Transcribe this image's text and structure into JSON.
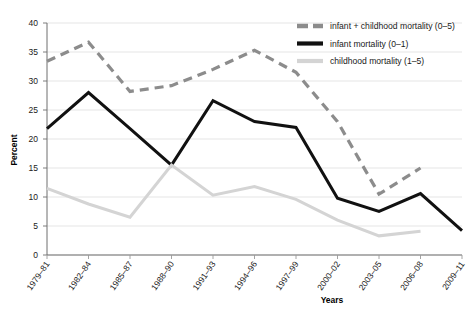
{
  "chart_data": {
    "type": "line",
    "title": "",
    "xlabel": "Years",
    "ylabel": "Percent",
    "ylim": [
      0,
      40
    ],
    "yticks": [
      0,
      5,
      10,
      15,
      20,
      25,
      30,
      35,
      40
    ],
    "grid": true,
    "legend_position": "top-right",
    "categories": [
      "1979–81",
      "1982–84",
      "1985–87",
      "1988–90",
      "1991–93",
      "1994–96",
      "1997–99",
      "2000–02",
      "2003–05",
      "2006–08",
      "2009–11"
    ],
    "series": [
      {
        "name": "infant + childhood mortality (0–5)",
        "color": "#8c8c8c",
        "style": "dashed",
        "width": 3.2,
        "values": [
          33.4,
          36.7,
          28.2,
          29.2,
          32.0,
          35.3,
          31.5,
          23.0,
          10.5,
          15.0,
          null
        ]
      },
      {
        "name": "infant mortality (0–1)",
        "color": "#111111",
        "style": "solid",
        "width": 3.0,
        "values": [
          21.8,
          28.0,
          21.8,
          15.5,
          26.6,
          23.0,
          22.0,
          9.8,
          7.5,
          10.6,
          4.2
        ]
      },
      {
        "name": "childhood mortality (1–5)",
        "color": "#d4d4d4",
        "style": "solid",
        "width": 3.0,
        "values": [
          11.5,
          8.8,
          6.5,
          15.5,
          10.3,
          11.8,
          9.6,
          6.0,
          3.3,
          4.1,
          null
        ]
      }
    ]
  },
  "legend": {
    "items": [
      {
        "label": "infant + childhood mortality (0–5)"
      },
      {
        "label": "infant mortality (0–1)"
      },
      {
        "label": "childhood mortality (1–5)"
      }
    ]
  },
  "axes": {
    "y_title": "Percent",
    "x_title": "Years"
  }
}
